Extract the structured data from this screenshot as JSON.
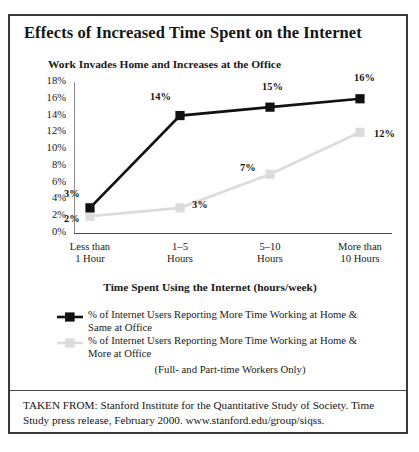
{
  "figure": {
    "title": "Effects of Increased Time Spent on the Internet",
    "subtitle": "Work Invades Home and Increases at the Office"
  },
  "chart_data": {
    "type": "line",
    "title": "Work Invades Home and Increases at the Office",
    "xlabel": "Time Spent Using the Internet (hours/week)",
    "ylabel": "",
    "categories": [
      "Less than 1 Hour",
      "1–5 Hours",
      "5–10 Hours",
      "More than 10 Hours"
    ],
    "category_lines": [
      [
        "Less than",
        "1 Hour"
      ],
      [
        "1–5",
        "Hours"
      ],
      [
        "5–10",
        "Hours"
      ],
      [
        "More than",
        "10 Hours"
      ]
    ],
    "series": [
      {
        "name": "% of Internet Users Reporting More Time Working at Home & Same at Office",
        "color": "#111111",
        "values": [
          3,
          14,
          15,
          16
        ],
        "labels": [
          "3%",
          "14%",
          "15%",
          "16%"
        ]
      },
      {
        "name": "% of Internet Users Reporting More Time Working at Home & More at Office",
        "color": "#dcdcdc",
        "values": [
          2,
          3,
          7,
          12
        ],
        "labels": [
          "2%",
          "3%",
          "7%",
          "12%"
        ]
      }
    ],
    "ylim": [
      0,
      18
    ],
    "ytick_values": [
      18,
      16,
      14,
      12,
      10,
      8,
      6,
      4,
      2,
      0
    ],
    "ytick_labels": [
      "18%",
      "16%",
      "14%",
      "12%",
      "10%",
      "8%",
      "6%",
      "4%",
      "2%",
      "0%"
    ],
    "grid": false,
    "legend_position": "below"
  },
  "legend": {
    "entries": [
      {
        "line1": "% of Internet Users Reporting More Time Working at Home &",
        "line2": "Same at Office",
        "color": "#111111"
      },
      {
        "line1": "% of Internet Users Reporting More Time Working at Home &",
        "line2": "More at Office",
        "color": "#dcdcdc"
      }
    ],
    "note": "(Full- and Part-time Workers Only)"
  },
  "source": {
    "line1": "TAKEN FROM: Stanford Institute for the Quantitative Study of Society.",
    "line2": "Time Study press release, February 2000. www.stanford.edu/group/siqss."
  }
}
